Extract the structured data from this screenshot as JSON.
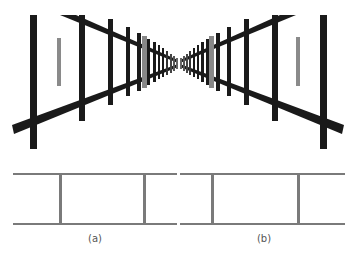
{
  "figure": {
    "colors": {
      "frame": "#1a1a1a",
      "target": "#8a8a8a",
      "ladder": "#7a7a7a",
      "background": "#ffffff"
    },
    "panels": [
      {
        "id": "a",
        "label": "(a)"
      },
      {
        "id": "b",
        "label": "(b)"
      }
    ]
  }
}
